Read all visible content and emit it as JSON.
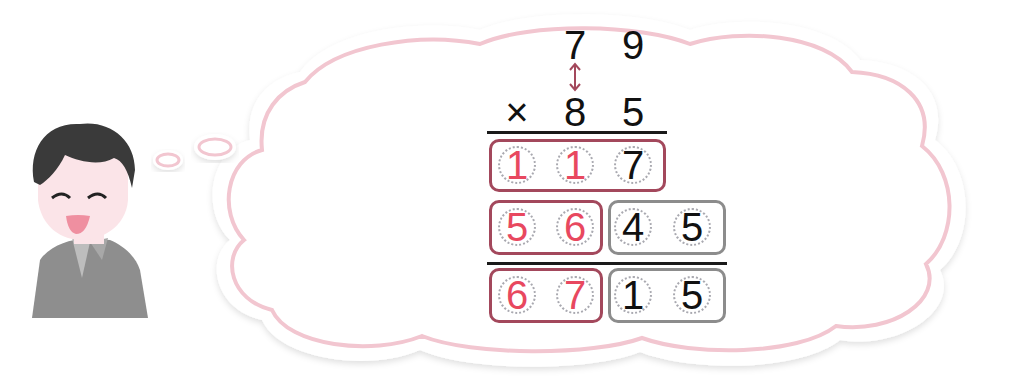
{
  "problem": {
    "multiplicand": [
      "7",
      "9"
    ],
    "operator": "×",
    "multiplier": [
      "8",
      "5"
    ]
  },
  "partial_products": [
    {
      "digits": [
        "1",
        "1",
        "7"
      ],
      "colors": [
        "red",
        "red",
        "black"
      ]
    },
    {
      "digits": [
        "5",
        "6",
        "4",
        "5"
      ],
      "colors": [
        "red",
        "red",
        "black",
        "black"
      ]
    }
  ],
  "result": {
    "digits": [
      "6",
      "7",
      "1",
      "5"
    ],
    "colors": [
      "red",
      "red",
      "black",
      "black"
    ]
  },
  "icons": {
    "character": "smiling-boy-icon",
    "thought_bubble": "thought-cloud-icon",
    "arrow": "double-arrow-vertical-icon"
  },
  "colors": {
    "accent_red": "#e8485f",
    "box_red": "#a3485c",
    "box_gray": "#8c8c8c",
    "cloud_outline": "#f2c6d0",
    "hair": "#3a3a3a",
    "shirt": "#8e8e8e",
    "skin": "#fbe4e8"
  }
}
